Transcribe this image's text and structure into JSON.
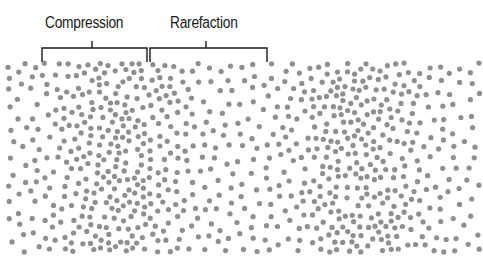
{
  "diagram": {
    "type": "longitudinal-wave",
    "labels": {
      "compression": "Compression",
      "rarefaction": "Rarefaction"
    },
    "brackets": [
      {
        "name": "compression-bracket",
        "x1": 42,
        "x2": 147,
        "y": 48,
        "tick_x": 92,
        "tick_top": 41,
        "end_bottom": 62
      },
      {
        "name": "rarefaction-bracket",
        "x1": 150,
        "x2": 267,
        "y": 48,
        "tick_x": 206,
        "tick_top": 41,
        "end_bottom": 62
      }
    ],
    "particle_field": {
      "x_range": [
        8,
        480
      ],
      "y_range": [
        63,
        252
      ],
      "dot_color": "#8f8f8f",
      "dot_radius": 2.6,
      "compression_centers_x": [
        120,
        360
      ],
      "wavelength_px": 240
    },
    "line_color": "#1a1a1a"
  }
}
